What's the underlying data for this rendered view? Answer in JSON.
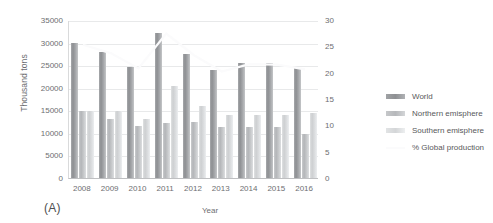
{
  "chart_data": {
    "type": "bar",
    "title": "",
    "panel_label": "(A)",
    "xlabel": "Year",
    "ylabel": "Thousand tons",
    "y2label": "",
    "categories": [
      "2008",
      "2009",
      "2010",
      "2011",
      "2012",
      "2013",
      "2014",
      "2015",
      "2016"
    ],
    "ylim": [
      0,
      35000
    ],
    "yticks": [
      0,
      5000,
      10000,
      15000,
      20000,
      25000,
      30000,
      35000
    ],
    "ytick_labels": [
      "0",
      "5000",
      "10000",
      "15000",
      "20000",
      "25000",
      "30000",
      "35000"
    ],
    "y2lim": [
      0,
      30
    ],
    "y2ticks": [
      0,
      5,
      10,
      15,
      20,
      25,
      30
    ],
    "y2tick_labels": [
      "0",
      "5",
      "10",
      "15",
      "20",
      "25",
      "30"
    ],
    "grid": true,
    "legend_position": "right",
    "series": [
      {
        "name": "World",
        "axis": "left",
        "color": "#8d8f92",
        "values": [
          29800,
          28000,
          24600,
          32200,
          27500,
          23900,
          25500,
          25400,
          24300
        ]
      },
      {
        "name": "Northern emisphere",
        "axis": "left",
        "color": "#b3b5b8",
        "values": [
          14900,
          13100,
          11500,
          12100,
          12500,
          11400,
          11300,
          11400,
          9800
        ]
      },
      {
        "name": "Southern emisphere",
        "axis": "left",
        "color": "#cdcfd1",
        "values": [
          14900,
          14800,
          13000,
          20400,
          15900,
          14000,
          13900,
          14000,
          14400
        ]
      },
      {
        "name": "% Global production",
        "axis": "right",
        "color": "#fbfbfc",
        "type": "line",
        "values": [
          25.5,
          23.9,
          21.0,
          27.6,
          23.5,
          20.4,
          21.8,
          21.7,
          20.8
        ]
      }
    ]
  }
}
